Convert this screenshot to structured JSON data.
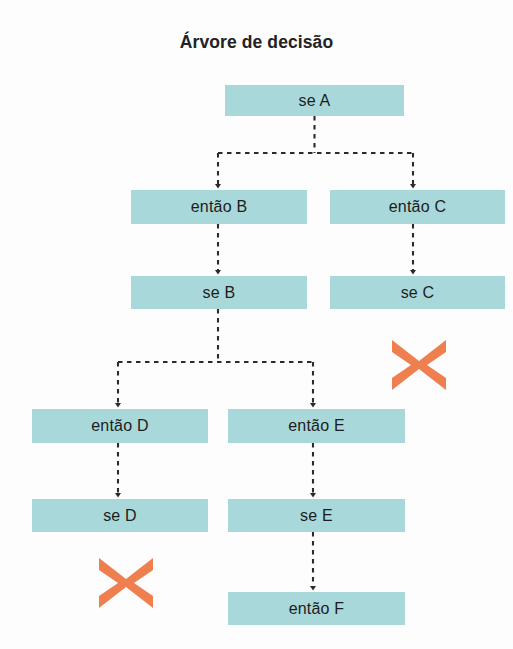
{
  "diagram": {
    "title": "Árvore de decisão",
    "type": "decision-tree",
    "background_color": "#fdfdfe",
    "node_fill_color": "#a8d8da",
    "node_text_color": "#1d1d1d",
    "edge_color": "#2b2b2b",
    "edge_style": "dashed-with-arrowhead",
    "reject_marker_color": "#ef7f4f",
    "nodes": [
      {
        "id": "seA",
        "label": "se A",
        "x": 225,
        "y": 85,
        "w": 179,
        "h": 31
      },
      {
        "id": "entaoB",
        "label": "então B",
        "x": 131,
        "y": 190,
        "w": 176,
        "h": 34
      },
      {
        "id": "entaoC",
        "label": "então C",
        "x": 330,
        "y": 190,
        "w": 175,
        "h": 34
      },
      {
        "id": "seB",
        "label": "se B",
        "x": 131,
        "y": 276,
        "w": 176,
        "h": 33
      },
      {
        "id": "seC",
        "label": "se C",
        "x": 330,
        "y": 276,
        "w": 175,
        "h": 33
      },
      {
        "id": "entaoD",
        "label": "então D",
        "x": 32,
        "y": 409,
        "w": 176,
        "h": 34
      },
      {
        "id": "entaoE",
        "label": "então E",
        "x": 228,
        "y": 409,
        "w": 177,
        "h": 34
      },
      {
        "id": "seD",
        "label": "se D",
        "x": 32,
        "y": 499,
        "w": 176,
        "h": 33
      },
      {
        "id": "seE",
        "label": "se E",
        "x": 228,
        "y": 499,
        "w": 177,
        "h": 33
      },
      {
        "id": "entaoF",
        "label": "então F",
        "x": 228,
        "y": 592,
        "w": 177,
        "h": 33
      }
    ],
    "edges": [
      {
        "from": "seA",
        "to": "entaoB",
        "kind": "branch"
      },
      {
        "from": "seA",
        "to": "entaoC",
        "kind": "branch"
      },
      {
        "from": "entaoB",
        "to": "seB",
        "kind": "straight"
      },
      {
        "from": "entaoC",
        "to": "seC",
        "kind": "straight"
      },
      {
        "from": "seB",
        "to": "entaoD",
        "kind": "branch"
      },
      {
        "from": "seB",
        "to": "entaoE",
        "kind": "branch"
      },
      {
        "from": "entaoD",
        "to": "seD",
        "kind": "straight"
      },
      {
        "from": "entaoE",
        "to": "seE",
        "kind": "straight"
      },
      {
        "from": "seE",
        "to": "entaoF",
        "kind": "straight"
      }
    ],
    "reject_markers": [
      {
        "id": "x-below-seC",
        "label": "X",
        "attached_to": "seC",
        "cx": 419,
        "cy": 365,
        "size": 66
      },
      {
        "id": "x-below-seD",
        "label": "X",
        "attached_to": "seD",
        "cx": 126,
        "cy": 583,
        "size": 66
      }
    ]
  }
}
